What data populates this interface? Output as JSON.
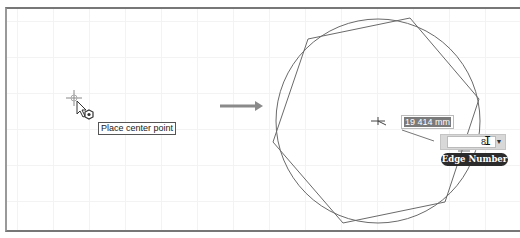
{
  "step_before": {
    "tooltip": "Place center point",
    "cursor_icons": [
      "crosshair-icon",
      "arrow-pointer-icon",
      "polygon-tool-icon"
    ]
  },
  "transition_arrow": {
    "icon": "arrow-right-icon",
    "color": "#8a8a8a"
  },
  "step_after": {
    "shape": "polygon",
    "polygon_sides_drawn": 6,
    "dimension": {
      "value": "19.414 mm",
      "display": "19 414 mm"
    },
    "edge_input": {
      "value": "8",
      "dropdown_icon": "dropdown-arrow-icon"
    },
    "edge_tooltip": "Edge Number"
  },
  "colors": {
    "geometry_line": "#6a6a6a",
    "tooltip_dark_bg": "#2b2b2b",
    "frame_border": "#777777"
  }
}
